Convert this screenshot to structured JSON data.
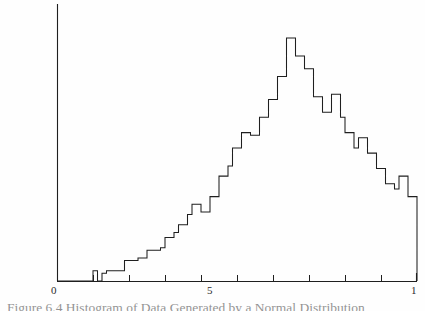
{
  "figure": {
    "caption_prefix": "Figure 6.4",
    "caption_body": "Histogram of Data Generated by a Normal Distribution",
    "caption_full": "Figure 6.4  Histogram of Data Generated by a Normal Distribution"
  },
  "axis": {
    "labels": {
      "left": "0",
      "middle": "5",
      "right": "1"
    },
    "tick_count": 11,
    "line_color": "#1f1f1f",
    "x_min": 0,
    "x_max": 1
  },
  "chart_data": {
    "type": "bar",
    "title": "Figure 6.4  Histogram of Data Generated by a Normal Distribution",
    "xlabel": "",
    "ylabel": "",
    "grid": false,
    "legend": false,
    "xlim": [
      0,
      1
    ],
    "ylim": [
      0,
      100
    ],
    "xticks": [
      0,
      0.1,
      0.2,
      0.3,
      0.4,
      0.5,
      0.6,
      0.7,
      0.8,
      0.9,
      1.0
    ],
    "xticklabels": [
      "0",
      "",
      "",
      "",
      "",
      "5",
      "",
      "",
      "",
      "",
      "1"
    ],
    "bin_width": 0.0125,
    "bin_count": 80,
    "x": [
      0.00625,
      0.01875,
      0.03125,
      0.04375,
      0.05625,
      0.06875,
      0.08125,
      0.09375,
      0.10625,
      0.11875,
      0.13125,
      0.14375,
      0.15625,
      0.16875,
      0.18125,
      0.19375,
      0.20625,
      0.21875,
      0.23125,
      0.24375,
      0.25625,
      0.26875,
      0.28125,
      0.29375,
      0.30625,
      0.31875,
      0.33125,
      0.34375,
      0.35625,
      0.36875,
      0.38125,
      0.39375,
      0.40625,
      0.41875,
      0.43125,
      0.44375,
      0.45625,
      0.46875,
      0.48125,
      0.49375,
      0.50625,
      0.51875,
      0.53125,
      0.54375,
      0.55625,
      0.56875,
      0.58125,
      0.59375,
      0.60625,
      0.61875,
      0.63125,
      0.64375,
      0.65625,
      0.66875,
      0.68125,
      0.69375,
      0.70625,
      0.71875,
      0.73125,
      0.74375,
      0.75625,
      0.76875,
      0.78125,
      0.79375,
      0.80625,
      0.81875,
      0.83125,
      0.84375,
      0.85625,
      0.86875,
      0.88125,
      0.89375,
      0.90625,
      0.91875,
      0.93125,
      0.94375,
      0.95625,
      0.96875,
      0.98125,
      0.99375
    ],
    "values": [
      0,
      0,
      0,
      0,
      0,
      0,
      0,
      0,
      4,
      0,
      3,
      4,
      4,
      4,
      4,
      8,
      8,
      8,
      9,
      9,
      12,
      12,
      12,
      13,
      17,
      17,
      19,
      22,
      22,
      26,
      30,
      30,
      27,
      27,
      33,
      33,
      41,
      41,
      45,
      52,
      52,
      58,
      58,
      57,
      57,
      64,
      64,
      71,
      71,
      80,
      80,
      95,
      95,
      88,
      88,
      83,
      83,
      72,
      72,
      66,
      66,
      73,
      73,
      64,
      58,
      58,
      52,
      56,
      56,
      50,
      50,
      44,
      44,
      38,
      38,
      36,
      41,
      41,
      33,
      33
    ]
  }
}
